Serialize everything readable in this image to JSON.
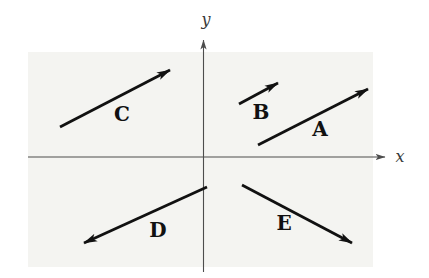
{
  "figure": {
    "background_color": "#ffffff",
    "plot_region": {
      "x": 28,
      "y": 52,
      "width": 345,
      "height": 215,
      "fill": "#f4f4f1"
    },
    "axes": {
      "color": "#4d4d4d",
      "stroke_width": 1.1,
      "x": {
        "label": "x",
        "x1": 28,
        "y1": 157,
        "x2": 385,
        "y2": 157,
        "label_x": 400,
        "label_y": 156
      },
      "y": {
        "label": "y",
        "x1": 203.5,
        "y1": 272,
        "x2": 203.5,
        "y2": 40,
        "label_x": 206,
        "label_y": 19
      }
    },
    "vector_color": "#111111",
    "vector_stroke_width": 2.8,
    "vectors": [
      {
        "name": "A",
        "x1": 258,
        "y1": 145,
        "x2": 368,
        "y2": 89,
        "label_x": 320,
        "label_y": 129
      },
      {
        "name": "B",
        "x1": 239,
        "y1": 104,
        "x2": 278,
        "y2": 83,
        "label_x": 261,
        "label_y": 112
      },
      {
        "name": "C",
        "x1": 60,
        "y1": 127,
        "x2": 170,
        "y2": 70,
        "label_x": 122,
        "label_y": 114
      },
      {
        "name": "D",
        "x1": 207,
        "y1": 187,
        "x2": 84,
        "y2": 243,
        "label_x": 158,
        "label_y": 230
      },
      {
        "name": "E",
        "x1": 242,
        "y1": 185,
        "x2": 352,
        "y2": 243,
        "label_x": 284,
        "label_y": 223
      }
    ]
  }
}
